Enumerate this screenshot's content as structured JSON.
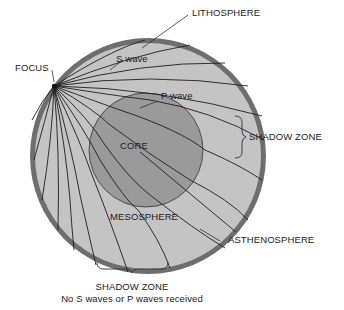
{
  "labels": {
    "lithosphere": "LITHOSPHERE",
    "s_wave": "S wave",
    "focus": "FOCUS",
    "p_wave": "P wave",
    "shadow_zone_right": "SHADOW ZONE",
    "core": "CORE",
    "mesosphere": "MESOSPHERE",
    "asthenosphere": "ASTHENOSPHERE",
    "shadow_zone_bottom": "SHADOW ZONE",
    "shadow_zone_note": "No S waves or P waves received"
  },
  "colors": {
    "lithosphere_ring": "#6e6e6e",
    "mantle": "#c4c4c4",
    "core": "#9a9a9a",
    "wave_lines": "#1e1e1e",
    "text": "#222222"
  }
}
